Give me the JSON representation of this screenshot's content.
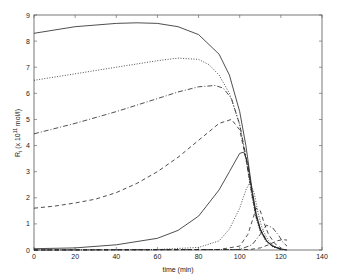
{
  "chart_data": {
    "type": "line",
    "title": "",
    "xlabel": "time (min)",
    "ylabel": "R_i (x 10^11 mol/l)",
    "ylabel_parts": {
      "main": "R",
      "sub": "i",
      "pre": " (x 10",
      "sup": "11",
      "post": " mol/l)"
    },
    "xlim": [
      0,
      140
    ],
    "ylim": [
      0,
      9
    ],
    "xticks": [
      0,
      20,
      40,
      60,
      80,
      100,
      120,
      140
    ],
    "yticks": [
      0,
      1,
      2,
      3,
      4,
      5,
      6,
      7,
      8,
      9
    ],
    "grid": false,
    "legend": null,
    "series": [
      {
        "name": "R1",
        "style": "solid",
        "x": [
          0,
          20,
          40,
          50,
          60,
          70,
          80,
          90,
          95,
          100,
          103,
          106,
          108,
          110,
          113,
          116,
          120,
          123
        ],
        "y": [
          8.3,
          8.55,
          8.68,
          8.7,
          8.68,
          8.55,
          8.25,
          7.5,
          6.7,
          5.3,
          4.0,
          2.3,
          1.4,
          0.8,
          0.35,
          0.15,
          0.04,
          0.0
        ]
      },
      {
        "name": "R2",
        "style": "dotted",
        "x": [
          0,
          20,
          40,
          60,
          70,
          80,
          85,
          90,
          95,
          100,
          103,
          106,
          108,
          110,
          113,
          116,
          120
        ],
        "y": [
          6.5,
          6.75,
          7.0,
          7.25,
          7.35,
          7.3,
          7.1,
          6.7,
          6.0,
          4.8,
          3.5,
          2.0,
          1.2,
          0.7,
          0.3,
          0.12,
          0.02
        ]
      },
      {
        "name": "R3",
        "style": "dashdot",
        "x": [
          0,
          20,
          40,
          60,
          70,
          80,
          88,
          92,
          96,
          100,
          103,
          106,
          108,
          110,
          113,
          116,
          120
        ],
        "y": [
          4.45,
          4.85,
          5.3,
          5.8,
          6.05,
          6.25,
          6.3,
          6.2,
          5.8,
          4.8,
          3.6,
          2.2,
          1.3,
          0.8,
          0.35,
          0.15,
          0.03
        ]
      },
      {
        "name": "R4",
        "style": "dashed",
        "x": [
          0,
          10,
          20,
          30,
          40,
          50,
          60,
          70,
          80,
          90,
          96,
          100,
          103,
          106,
          108,
          110,
          113,
          116,
          120
        ],
        "y": [
          1.6,
          1.68,
          1.8,
          1.95,
          2.2,
          2.55,
          3.0,
          3.55,
          4.2,
          4.85,
          5.0,
          4.6,
          3.5,
          2.1,
          1.3,
          0.8,
          0.35,
          0.15,
          0.03
        ]
      },
      {
        "name": "R5",
        "style": "solid",
        "x": [
          0,
          20,
          40,
          60,
          70,
          80,
          90,
          95,
          100,
          102,
          104,
          106,
          108,
          110,
          113,
          116,
          120,
          123
        ],
        "y": [
          0.05,
          0.08,
          0.2,
          0.45,
          0.75,
          1.3,
          2.3,
          3.0,
          3.7,
          3.75,
          3.3,
          2.2,
          1.3,
          0.75,
          0.35,
          0.15,
          0.04,
          0.0
        ]
      },
      {
        "name": "R6",
        "style": "dotted",
        "x": [
          0,
          60,
          80,
          90,
          95,
          100,
          103,
          105,
          107,
          109,
          111,
          114,
          117,
          120
        ],
        "y": [
          0.0,
          0.02,
          0.1,
          0.35,
          0.8,
          1.6,
          2.3,
          2.6,
          2.2,
          1.4,
          0.8,
          0.35,
          0.12,
          0.03
        ]
      },
      {
        "name": "R7",
        "style": "dashed",
        "x": [
          0,
          90,
          100,
          104,
          106,
          108,
          110,
          112,
          114,
          117,
          120
        ],
        "y": [
          0.0,
          0.02,
          0.15,
          0.6,
          1.1,
          1.6,
          1.5,
          1.0,
          0.6,
          0.25,
          0.08
        ]
      },
      {
        "name": "R8",
        "style": "dashdot",
        "x": [
          0,
          100,
          106,
          110,
          113,
          116,
          119,
          121,
          123
        ],
        "y": [
          0.0,
          0.02,
          0.2,
          0.6,
          0.95,
          0.85,
          0.55,
          0.3,
          0.15
        ]
      },
      {
        "name": "R9",
        "style": "dashed",
        "x": [
          0,
          105,
          110,
          114,
          118,
          121,
          123
        ],
        "y": [
          0.0,
          0.02,
          0.08,
          0.2,
          0.35,
          0.4,
          0.38
        ]
      }
    ]
  }
}
